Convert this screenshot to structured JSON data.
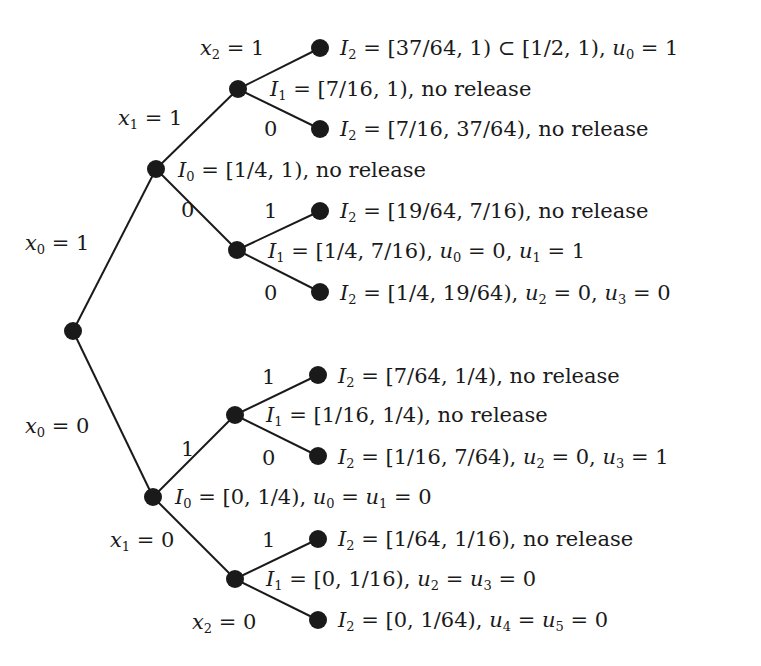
{
  "diagram": {
    "type": "binary-tree",
    "root": {
      "x": 73,
      "y": 331
    },
    "nodes": [
      {
        "id": "root",
        "x": 73,
        "y": 331
      },
      {
        "id": "n1",
        "x": 156,
        "y": 169
      },
      {
        "id": "n0",
        "x": 153,
        "y": 497
      },
      {
        "id": "n11",
        "x": 238,
        "y": 89
      },
      {
        "id": "n10",
        "x": 237,
        "y": 250
      },
      {
        "id": "n01",
        "x": 235,
        "y": 415
      },
      {
        "id": "n00",
        "x": 235,
        "y": 579
      },
      {
        "id": "n111",
        "x": 320,
        "y": 48
      },
      {
        "id": "n110",
        "x": 320,
        "y": 129
      },
      {
        "id": "n101",
        "x": 320,
        "y": 211
      },
      {
        "id": "n100",
        "x": 320,
        "y": 292
      },
      {
        "id": "n011",
        "x": 318,
        "y": 375
      },
      {
        "id": "n010",
        "x": 318,
        "y": 456
      },
      {
        "id": "n001",
        "x": 318,
        "y": 539
      },
      {
        "id": "n000",
        "x": 318,
        "y": 620
      }
    ],
    "edges": [
      [
        "root",
        "n1"
      ],
      [
        "root",
        "n0"
      ],
      [
        "n1",
        "n11"
      ],
      [
        "n1",
        "n10"
      ],
      [
        "n0",
        "n01"
      ],
      [
        "n0",
        "n00"
      ],
      [
        "n11",
        "n111"
      ],
      [
        "n11",
        "n110"
      ],
      [
        "n10",
        "n101"
      ],
      [
        "n10",
        "n100"
      ],
      [
        "n01",
        "n011"
      ],
      [
        "n01",
        "n010"
      ],
      [
        "n00",
        "n001"
      ],
      [
        "n00",
        "n000"
      ]
    ],
    "edge_labels": [
      {
        "id": "x0-1",
        "text": "x0 = 1",
        "x": 25,
        "y": 233
      },
      {
        "id": "x0-0",
        "text": "x0 = 0",
        "x": 25,
        "y": 416
      },
      {
        "id": "x1-1",
        "text": "x1 = 1",
        "x": 118,
        "y": 108
      },
      {
        "id": "e10-0",
        "text": "0",
        "x": 181,
        "y": 200
      },
      {
        "id": "x2-1",
        "text": "x2 = 1",
        "x": 200,
        "y": 38
      },
      {
        "id": "e110-0",
        "text": "0",
        "x": 264,
        "y": 119
      },
      {
        "id": "e101-1",
        "text": "1",
        "x": 264,
        "y": 201
      },
      {
        "id": "e100-0",
        "text": "0",
        "x": 264,
        "y": 283
      },
      {
        "id": "e01-1",
        "text": "1",
        "x": 181,
        "y": 439
      },
      {
        "id": "e011-1",
        "text": "1",
        "x": 262,
        "y": 367
      },
      {
        "id": "e010-0",
        "text": "0",
        "x": 262,
        "y": 448
      },
      {
        "id": "x1-0",
        "text": "x1 = 0",
        "x": 110,
        "y": 530
      },
      {
        "id": "e001-1",
        "text": "1",
        "x": 262,
        "y": 530
      },
      {
        "id": "x2-0",
        "text": "x2 = 0",
        "x": 192,
        "y": 612
      }
    ],
    "node_labels": [
      {
        "id": "I0-top",
        "text": "I0 = [1/4, 1), no release",
        "x": 178,
        "y": 160
      },
      {
        "id": "I0-bottom",
        "text": "I0 = [0, 1/4), u0 = u1 = 0",
        "x": 175,
        "y": 487
      },
      {
        "id": "I1-11",
        "text": "I1 = [7/16, 1), no release",
        "x": 270,
        "y": 79
      },
      {
        "id": "I1-10",
        "text": "I1 = [1/4, 7/16), u0 = 0,  u1 = 1",
        "x": 268,
        "y": 241
      },
      {
        "id": "I1-01",
        "text": "I1 = [1/16, 1/4), no release",
        "x": 266,
        "y": 405
      },
      {
        "id": "I1-00",
        "text": "I1 = [0, 1/16), u2 = u3 = 0",
        "x": 266,
        "y": 569
      },
      {
        "id": "I2-111",
        "text": "I2 = [37/64, 1) ⊂ [1/2, 1), u0 = 1",
        "x": 340,
        "y": 38
      },
      {
        "id": "I2-110",
        "text": "I2 = [7/16, 37/64), no release",
        "x": 340,
        "y": 119
      },
      {
        "id": "I2-101",
        "text": "I2 = [19/64, 7/16), no release",
        "x": 340,
        "y": 201
      },
      {
        "id": "I2-100",
        "text": "I2 = [1/4, 19/64), u2 = 0, u3 = 0",
        "x": 340,
        "y": 283
      },
      {
        "id": "I2-011",
        "text": "I2 = [7/64, 1/4), no release",
        "x": 338,
        "y": 366
      },
      {
        "id": "I2-010",
        "text": "I2 = [1/16, 7/64), u2 = 0, u3 = 1",
        "x": 338,
        "y": 447
      },
      {
        "id": "I2-001",
        "text": "I2 = [1/64, 1/16), no release",
        "x": 338,
        "y": 529
      },
      {
        "id": "I2-000",
        "text": "I2 = [0, 1/64), u4 = u5 = 0",
        "x": 338,
        "y": 610
      }
    ],
    "colors": {
      "ink": "#1a1a1a",
      "background": "#ffffff"
    }
  }
}
